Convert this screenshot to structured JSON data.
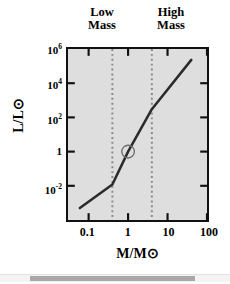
{
  "chart_data": {
    "type": "line",
    "title": "",
    "xlabel": "M/M⊙",
    "ylabel": "L/L⊙",
    "xscale": "log",
    "yscale": "log",
    "xlim": [
      0.03,
      100
    ],
    "ylim": [
      0.0001,
      1000000
    ],
    "xticks": [
      {
        "value": 0.1,
        "label": "0.1"
      },
      {
        "value": 1,
        "label": "1"
      },
      {
        "value": 10,
        "label": "10"
      },
      {
        "value": 100,
        "label": "100"
      }
    ],
    "yticks": [
      {
        "value": 1000000,
        "label": "10",
        "exp": "6"
      },
      {
        "value": 10000,
        "label": "10",
        "exp": "4"
      },
      {
        "value": 100,
        "label": "10",
        "exp": "2"
      },
      {
        "value": 1,
        "label": "1",
        "exp": ""
      },
      {
        "value": 0.01,
        "label": "10",
        "exp": "-2"
      }
    ],
    "grid": false,
    "legend": null,
    "plot_background": "#dedede",
    "series": [
      {
        "name": "mass-luminosity relation",
        "color": "#2b2b2b",
        "points": [
          {
            "x": 0.06,
            "y": 0.0005
          },
          {
            "x": 0.4,
            "y": 0.012
          },
          {
            "x": 1.0,
            "y": 1.0
          },
          {
            "x": 4.0,
            "y": 300
          },
          {
            "x": 40.0,
            "y": 230000
          }
        ]
      }
    ],
    "markers": [
      {
        "name": "sun-marker",
        "x": 1.0,
        "y": 1.0,
        "shape": "circle",
        "color": "#6b6b6b",
        "filled": false
      }
    ],
    "vlines": [
      {
        "name": "low-mass-boundary",
        "x": 0.4,
        "style": "dotted",
        "color": "#8a8a8a"
      },
      {
        "name": "high-mass-boundary",
        "x": 4.0,
        "style": "dotted",
        "color": "#8a8a8a"
      }
    ],
    "annotations": [
      {
        "name": "low-mass",
        "text": "Low\nMass",
        "x_range": [
          0.4,
          4.0
        ],
        "position": "above-axis-left"
      },
      {
        "name": "high-mass",
        "text": "High\nMass",
        "x_range": [
          4.0,
          100
        ],
        "position": "above-axis-right"
      }
    ]
  },
  "labels": {
    "low_mass": "Low\nMass",
    "high_mass": "High\nMass",
    "y_axis_title": "L/L⊙",
    "x_axis_title": "M/M⊙"
  },
  "scrollbar": {
    "orientation": "horizontal",
    "thumb_color": "#a8a8a8",
    "track_color": "#f4f4f4"
  }
}
